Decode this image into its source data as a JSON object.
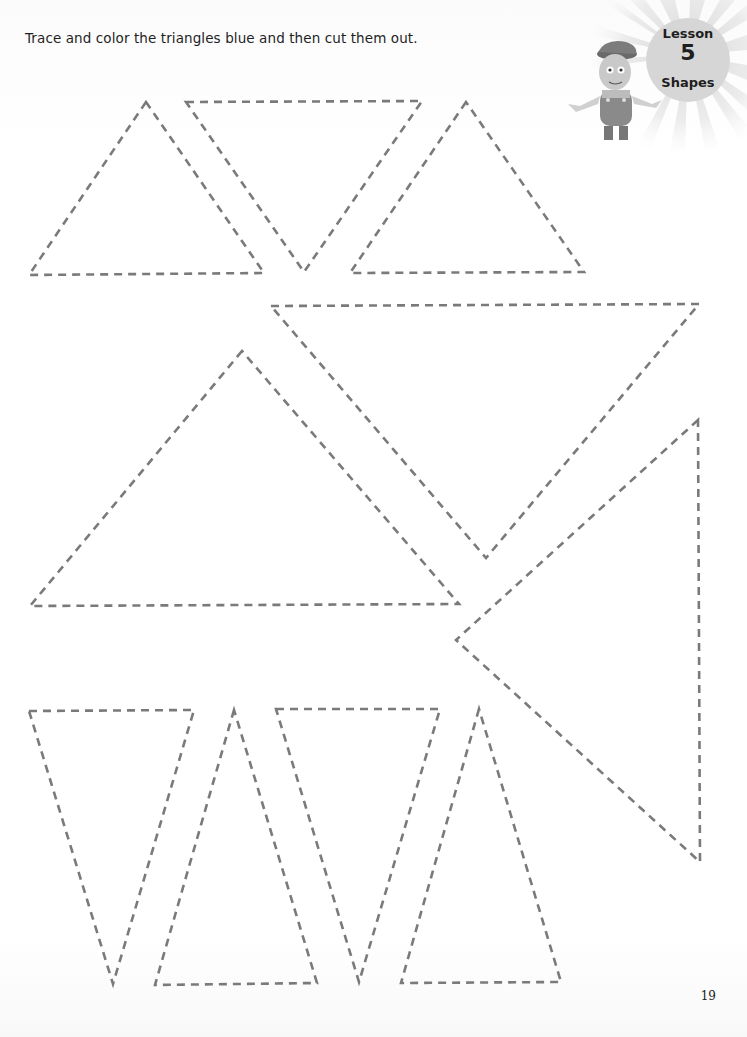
{
  "page": {
    "instruction": "Trace and color the triangles blue and then cut them out.",
    "page_number": "19"
  },
  "badge": {
    "lesson_label": "Lesson",
    "lesson_number": "5",
    "topic": "Shapes",
    "mascot": "cartoon-boy-mascot"
  },
  "style": {
    "dash_color": "#7a7a7a",
    "background": "#ffffff"
  },
  "triangles": [
    {
      "id": "t1",
      "points": "146,102 29,275 264,273"
    },
    {
      "id": "t2",
      "points": "186,102 422,101 304,272"
    },
    {
      "id": "t3",
      "points": "466,102 350,273 584,272"
    },
    {
      "id": "t4",
      "points": "271,306 699,304 486,558"
    },
    {
      "id": "t5",
      "points": "242,351 30,606 459,604"
    },
    {
      "id": "t6",
      "points": "698,420 456,640 700,862"
    },
    {
      "id": "t7",
      "points": "29,711 194,710 113,984"
    },
    {
      "id": "t8",
      "points": "234,710 155,985 317,983"
    },
    {
      "id": "t9",
      "points": "276,709 440,709 359,982"
    },
    {
      "id": "t10",
      "points": "479,709 401,983 561,982"
    }
  ]
}
